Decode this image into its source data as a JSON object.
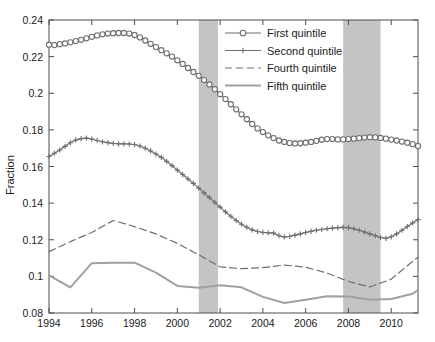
{
  "chart_data": {
    "type": "line",
    "title": "",
    "subtitle": "",
    "xlabel": "",
    "ylabel": "Fraction",
    "xlim": [
      1994,
      2011.25
    ],
    "ylim": [
      0.08,
      0.24
    ],
    "ytick_step": 0.02,
    "xtick_step": 2,
    "grid": false,
    "legend_position": "top-right",
    "xticks": [
      "1994",
      "1996",
      "1998",
      "2000",
      "2002",
      "2004",
      "2006",
      "2008",
      "2010"
    ],
    "xtick_values": [
      1994,
      1996,
      1998,
      2000,
      2002,
      2004,
      2006,
      2008,
      2010
    ],
    "yticks": [
      "0.08",
      "0.1",
      "0.12",
      "0.14",
      "0.16",
      "0.18",
      "0.2",
      "0.22",
      "0.24"
    ],
    "ytick_values": [
      0.08,
      0.1,
      0.12,
      0.14,
      0.16,
      0.18,
      0.2,
      0.22,
      0.24
    ],
    "shaded_regions": [
      {
        "name": "recession-2001",
        "x0": 2001.0,
        "x1": 2001.9,
        "color": "#c4c4c4"
      },
      {
        "name": "recession-2008",
        "x0": 2007.75,
        "x1": 2009.5,
        "color": "#c4c4c4"
      }
    ],
    "series": [
      {
        "name": "First quintile",
        "marker": "circle",
        "linestyle": "solid",
        "color": "#6e6e6e",
        "x": [
          1994,
          1994.25,
          1994.5,
          1994.75,
          1995,
          1995.25,
          1995.5,
          1995.75,
          1996,
          1996.25,
          1996.5,
          1996.75,
          1997,
          1997.25,
          1997.5,
          1997.75,
          1998,
          1998.25,
          1998.5,
          1998.75,
          1999,
          1999.25,
          1999.5,
          1999.75,
          2000,
          2000.25,
          2000.5,
          2000.75,
          2001,
          2001.25,
          2001.5,
          2001.75,
          2002,
          2002.25,
          2002.5,
          2002.75,
          2003,
          2003.25,
          2003.5,
          2003.75,
          2004,
          2004.25,
          2004.5,
          2004.75,
          2005,
          2005.25,
          2005.5,
          2005.75,
          2006,
          2006.25,
          2006.5,
          2006.75,
          2007,
          2007.25,
          2007.5,
          2007.75,
          2008,
          2008.25,
          2008.5,
          2008.75,
          2009,
          2009.25,
          2009.5,
          2009.75,
          2010,
          2010.25,
          2010.5,
          2010.75,
          2011,
          2011.25
        ],
        "values": [
          0.2265,
          0.2263,
          0.2268,
          0.2272,
          0.2278,
          0.2285,
          0.2292,
          0.23,
          0.2308,
          0.2316,
          0.2322,
          0.2326,
          0.2328,
          0.2329,
          0.2329,
          0.2326,
          0.2318,
          0.2305,
          0.2288,
          0.227,
          0.2252,
          0.2235,
          0.2218,
          0.22,
          0.218,
          0.216,
          0.2138,
          0.2116,
          0.2095,
          0.2072,
          0.2048,
          0.2022,
          0.1995,
          0.1968,
          0.194,
          0.1912,
          0.1885,
          0.1858,
          0.1832,
          0.1808,
          0.1788,
          0.177,
          0.1755,
          0.1742,
          0.1734,
          0.1728,
          0.1726,
          0.1727,
          0.173,
          0.1734,
          0.174,
          0.1746,
          0.175,
          0.175,
          0.1748,
          0.1748,
          0.175,
          0.1752,
          0.1755,
          0.1758,
          0.176,
          0.1759,
          0.1756,
          0.1752,
          0.1747,
          0.1742,
          0.1736,
          0.173,
          0.1722,
          0.1712
        ],
        "note": "Rises from 0.2265 in 1994 to a 0.2329 peak in 1997, declines steadily to a 0.1726 trough in 2005.5, plateaus near 0.175-0.176 through 2008-2009, then eases to 0.168 by 2011"
      },
      {
        "name": "Second quintile",
        "marker": "plus",
        "linestyle": "solid",
        "color": "#6e6e6e",
        "x": [
          1994,
          1994.25,
          1994.5,
          1994.75,
          1995,
          1995.25,
          1995.5,
          1995.75,
          1996,
          1996.25,
          1996.5,
          1996.75,
          1997,
          1997.25,
          1997.5,
          1997.75,
          1998,
          1998.25,
          1998.5,
          1998.75,
          1999,
          1999.25,
          1999.5,
          1999.75,
          2000,
          2000.25,
          2000.5,
          2000.75,
          2001,
          2001.25,
          2001.5,
          2001.75,
          2002,
          2002.25,
          2002.5,
          2002.75,
          2003,
          2003.25,
          2003.5,
          2003.75,
          2004,
          2004.25,
          2004.5,
          2004.75,
          2005,
          2005.25,
          2005.5,
          2005.75,
          2006,
          2006.25,
          2006.5,
          2006.75,
          2007,
          2007.25,
          2007.5,
          2007.75,
          2008,
          2008.25,
          2008.5,
          2008.75,
          2009,
          2009.25,
          2009.5,
          2009.75,
          2010,
          2010.25,
          2010.5,
          2010.75,
          2011,
          2011.25
        ],
        "values": [
          0.1655,
          0.1672,
          0.169,
          0.171,
          0.173,
          0.1745,
          0.1752,
          0.1755,
          0.175,
          0.1742,
          0.1735,
          0.173,
          0.1726,
          0.1724,
          0.1724,
          0.1723,
          0.172,
          0.1712,
          0.17,
          0.1685,
          0.1668,
          0.165,
          0.1628,
          0.1605,
          0.158,
          0.1556,
          0.1532,
          0.1508,
          0.1482,
          0.1456,
          0.143,
          0.1404,
          0.1378,
          0.1352,
          0.1328,
          0.1305,
          0.1285,
          0.1268,
          0.1254,
          0.1245,
          0.124,
          0.1238,
          0.1236,
          0.1222,
          0.1215,
          0.1218,
          0.1225,
          0.1232,
          0.124,
          0.1246,
          0.1252,
          0.1256,
          0.126,
          0.1263,
          0.1266,
          0.1268,
          0.1266,
          0.126,
          0.1252,
          0.1242,
          0.1232,
          0.1222,
          0.1212,
          0.1208,
          0.1216,
          0.1232,
          0.1252,
          0.1272,
          0.1292,
          0.131
        ],
        "note": "Peaks at 0.1755 in 1995.75, declines to 0.1215 by 2005, mild recovery to 0.1268 in 2007.75, dips to 0.1208 in 2009.75, then rises to 0.131 by 2011"
      },
      {
        "name": "Fourth quintile",
        "marker": "none",
        "linestyle": "dashed",
        "color": "#6e6e6e",
        "x": [
          1994,
          1995,
          1996,
          1997,
          1998,
          1999,
          2000,
          2001,
          2002,
          2003,
          2004,
          2005,
          2006,
          2007,
          2008,
          2009,
          2010,
          2011,
          2011.25
        ],
        "values": [
          0.1135,
          0.119,
          0.124,
          0.1305,
          0.1272,
          0.1232,
          0.118,
          0.1118,
          0.1052,
          0.1042,
          0.1048,
          0.1062,
          0.105,
          0.1018,
          0.0972,
          0.0942,
          0.0985,
          0.1082,
          0.1105
        ],
        "note": "Dashed line; peaks 0.1305 at 1997, long decline to a 0.0942 trough in 2009, sharp rebound to 0.1105 by 2011"
      },
      {
        "name": "Fifth quintile",
        "marker": "none",
        "linestyle": "solid",
        "color": "#a0a0a0",
        "linewidth": "thick",
        "x": [
          1994,
          1995,
          1996,
          1997,
          1998,
          1999,
          2000,
          2001,
          2002,
          2003,
          2004,
          2005,
          2006,
          2007,
          2008,
          2009,
          2010,
          2011,
          2011.25
        ],
        "values": [
          0.1005,
          0.094,
          0.1072,
          0.1075,
          0.1075,
          0.102,
          0.0948,
          0.0938,
          0.0952,
          0.094,
          0.0888,
          0.0855,
          0.0872,
          0.0892,
          0.089,
          0.0872,
          0.0876,
          0.0905,
          0.0925
        ],
        "note": "Lightest, thickest line; dips to 0.0940 in 1995, plateau near 0.1075 through 1996-1998, falls to a 0.0855 trough in 2005, ends at 0.0925"
      }
    ]
  },
  "legend": {
    "entries": [
      {
        "label": "First quintile",
        "style": "circle-marker-line"
      },
      {
        "label": "Second quintile",
        "style": "plus-marker-line"
      },
      {
        "label": "Fourth quintile",
        "style": "dashed-line"
      },
      {
        "label": "Fifth quintile",
        "style": "solid-thick-line"
      }
    ]
  },
  "axes": {
    "ylabel": "Fraction"
  },
  "colors": {
    "series_dark_gray": "#6e6e6e",
    "series_light_gray": "#a0a0a0",
    "shading": "#c4c4c4",
    "axis": "#4d4d4d",
    "text": "#1a1a1a",
    "background": "#ffffff"
  }
}
